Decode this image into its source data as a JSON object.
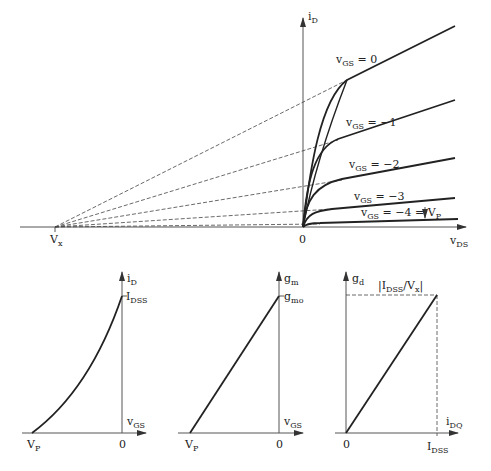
{
  "top_graph": {
    "y_axis_label": "i",
    "y_axis_sub": "D",
    "x_axis_label": "v",
    "x_axis_sub": "DS",
    "origin_label": "0",
    "vx_label": "V",
    "vx_sub": "x",
    "curves": [
      {
        "label_main": "v",
        "label_sub": "GS",
        "label_rest": " = 0"
      },
      {
        "label_main": "v",
        "label_sub": "GS",
        "label_rest": " = −1"
      },
      {
        "label_main": "v",
        "label_sub": "GS",
        "label_rest": " = −2"
      },
      {
        "label_main": "v",
        "label_sub": "GS",
        "label_rest": " = −3"
      },
      {
        "label_main": "v",
        "label_sub": "GS",
        "label_rest": " = −4 = V",
        "label_sub2": "P"
      }
    ]
  },
  "graph_transfer": {
    "y_axis_label": "i",
    "y_axis_sub": "D",
    "x_axis_label": "v",
    "x_axis_sub": "GS",
    "tick_y_label": "I",
    "tick_y_sub": "DSS",
    "origin_label": "0",
    "vp_label": "V",
    "vp_sub": "P"
  },
  "graph_gm": {
    "y_axis_label": "g",
    "y_axis_sub": "m",
    "x_axis_label": "v",
    "x_axis_sub": "GS",
    "tick_y_label": "g",
    "tick_y_sub": "mo",
    "origin_label": "0",
    "vp_label": "V",
    "vp_sub": "P"
  },
  "graph_gd": {
    "y_axis_label": "g",
    "y_axis_sub": "d",
    "x_axis_label": "i",
    "x_axis_sub": "DQ",
    "top_label_pre": "|I",
    "top_label_sub": "DSS",
    "top_label_mid": "/V",
    "top_label_sub2": "x",
    "top_label_post": "|",
    "origin_label": "0",
    "tick_x_label": "I",
    "tick_x_sub": "DSS"
  }
}
